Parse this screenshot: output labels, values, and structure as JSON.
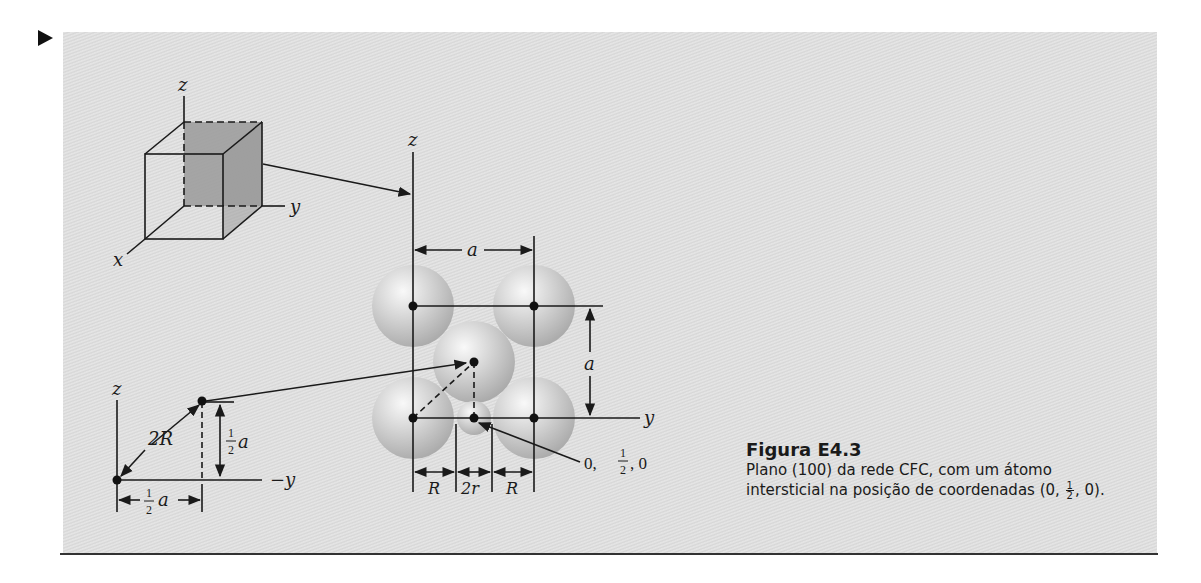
{
  "figure": {
    "marker": "▶",
    "cube_diagram": {
      "axes": {
        "z": "z",
        "y": "y",
        "x": "x"
      },
      "shaded_face": "(100) plane"
    },
    "triangle_diagram": {
      "axis_z": "z",
      "axis_y": "−y",
      "hypotenuse_label": "2R",
      "vertical_label_num": "1",
      "vertical_label_den": "2",
      "vertical_label_var": "a",
      "horizontal_label_num": "1",
      "horizontal_label_den": "2",
      "horizontal_label_var": "a"
    },
    "plane_diagram": {
      "axis_z": "z",
      "axis_y": "y",
      "top_dim": "a",
      "side_dim": "a",
      "bottom_dims": [
        "R",
        "2r",
        "R"
      ],
      "coord_prefix": "0,",
      "coord_num": "1",
      "coord_den": "2",
      "coord_suffix": ", 0"
    },
    "caption": {
      "title": "Figura E4.3",
      "line1": "Plano (100) da rede CFC, com um átomo",
      "line2_prefix": "intersticial na posição de coordenadas (0,",
      "line2_frac_num": "1",
      "line2_frac_den": "2",
      "line2_suffix": ", 0)."
    }
  }
}
